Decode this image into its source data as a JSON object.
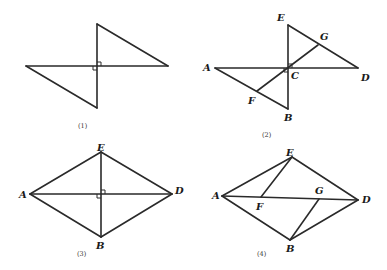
{
  "figures": [
    {
      "caption": "(1)",
      "points": {},
      "description": "Two right triangles meeting at a right angle vertex, forming a bowtie shape"
    },
    {
      "caption": "(2)",
      "points": {
        "A": "A",
        "B": "B",
        "C": "C",
        "D": "D",
        "E": "E",
        "F": "F",
        "G": "G"
      },
      "description": "Triangles ABC and DEC with perpendicular AD and EB at C; segment FG through C"
    },
    {
      "caption": "(3)",
      "points": {
        "A": "A",
        "B": "B",
        "D": "D",
        "E": "E"
      },
      "description": "Quadrilateral AEDB with perpendicular diagonals AD and EB"
    },
    {
      "caption": "(4)",
      "points": {
        "A": "A",
        "B": "B",
        "D": "D",
        "E": "E",
        "F": "F",
        "G": "G"
      },
      "description": "Quadrilateral AEDB with diagonal AD, segments EF and BG to AD"
    }
  ],
  "colors": {
    "stroke": "#2a2a2a",
    "background": "#ffffff"
  }
}
